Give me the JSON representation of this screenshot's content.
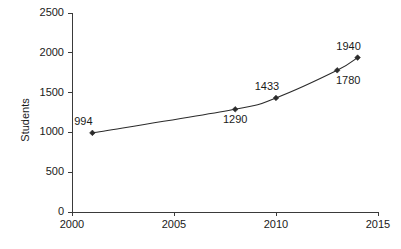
{
  "chart_data": {
    "type": "line",
    "title": "",
    "xlabel": "",
    "ylabel": "Students",
    "x": [
      2001,
      2008,
      2010,
      2013,
      2014
    ],
    "values": [
      994,
      1290,
      1433,
      1780,
      1940
    ],
    "point_labels": [
      "994",
      "1290",
      "1433",
      "1780",
      "1940"
    ],
    "label_positions": [
      "above-left",
      "below",
      "above-left",
      "below-right",
      "above-left"
    ],
    "xlim": [
      2000,
      2015
    ],
    "ylim": [
      0,
      2500
    ],
    "xticks": [
      2000,
      2005,
      2010,
      2015
    ],
    "xtick_labels": [
      "2000",
      "2005",
      "2010",
      "2015"
    ],
    "yticks": [
      0,
      500,
      1000,
      1500,
      2000,
      2500
    ],
    "ytick_labels": [
      "0",
      "500",
      "1000",
      "1500",
      "2000",
      "2500"
    ],
    "grid": false,
    "legend": "none",
    "marker": "diamond",
    "line_color": "#2b2b2b",
    "marker_color": "#2b2b2b",
    "axis_color": "#3a3a3a",
    "background_color": "#ffffff",
    "smooth": true
  }
}
